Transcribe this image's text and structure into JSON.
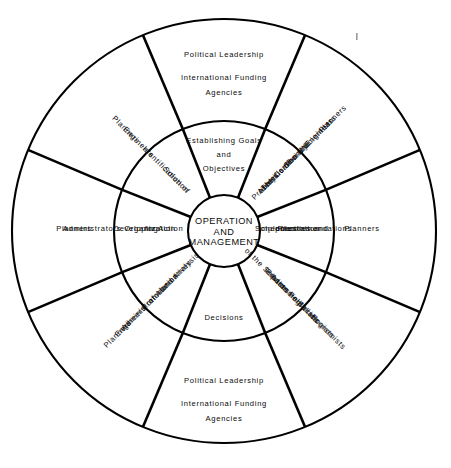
{
  "diagram": {
    "hub": {
      "line1": "OPERATION",
      "line2": "AND",
      "line3": "MANAGEMENT"
    },
    "inner_ring": [
      {
        "id": "establishing-goals",
        "text": "Establishing Goals and Objectives"
      },
      {
        "id": "identification-of-solution",
        "text": "Identification of Solution"
      },
      {
        "id": "developing-organization",
        "text": "Developing Organization for Action"
      },
      {
        "id": "formulation-of-alternatives",
        "text": "Formulation of Alternatives and Analysis"
      },
      {
        "id": "decisions",
        "text": "Decisions"
      },
      {
        "id": "assessing-impacts",
        "text": "Assessing Impacts of the Solution"
      },
      {
        "id": "recommendations",
        "text": "Recommendations priorities and Implementation Schedules"
      },
      {
        "id": "identification-of-problem",
        "text": "Identification and Analysis of Problem"
      }
    ],
    "inner_ring_lines": {
      "establishing-goals": [
        "Establishing Goals",
        "and",
        "Objectives"
      ],
      "identification-of-solution": [
        "Identification of",
        "Solution"
      ],
      "developing-organization": [
        "Developing",
        "Organization",
        "for Action"
      ],
      "formulation-of-alternatives": [
        "Formulation",
        "of Alternatives",
        "and Analysis"
      ],
      "decisions": [
        "Decisions"
      ],
      "assessing-impacts": [
        "Assessing",
        "Impacts",
        "of the Solution"
      ],
      "recommendations": [
        "Recommendations",
        "priorities and",
        "Implementation",
        "Schedules"
      ],
      "identification-of-problem": [
        "Identification and",
        "Analysis of",
        "Problem"
      ]
    },
    "outer_ring": [
      {
        "id": "top",
        "text": "Political Leadership International Funding Agencies",
        "lines": [
          "Political  Leadership",
          "International Funding",
          "Agencies"
        ]
      },
      {
        "id": "upper-right",
        "text": "Planners Engineers",
        "lines": [
          "Planners",
          "Engineers"
        ]
      },
      {
        "id": "right",
        "text": "Planners Administrators",
        "lines": [
          "Planners",
          "Administrators"
        ]
      },
      {
        "id": "lower-right",
        "text": "Planners Engineers Administrators",
        "lines": [
          "Planners",
          "Engineers",
          "Administrators"
        ]
      },
      {
        "id": "bottom",
        "text": "Political Leadership International Funding Agencies",
        "lines": [
          "Political  Leadership",
          "International Funding",
          "Agencies"
        ]
      },
      {
        "id": "lower-left",
        "text": "Economists Sociologists Politicians Environmentalists",
        "lines": [
          "Economists",
          "Sociologists",
          "Politicians",
          "Environmentalists"
        ]
      },
      {
        "id": "left",
        "text": "Planners",
        "lines": [
          "Planners"
        ]
      },
      {
        "id": "upper-left",
        "text": "Planners Engineers Social Scientists The UN The Community",
        "lines": [
          "Planners",
          "Engineers",
          "Social Scientists",
          "The UN",
          "The Community"
        ]
      }
    ],
    "colors": {
      "stroke": "#000000",
      "background": "#ffffff",
      "text": "#0b0b0b"
    },
    "geometry": {
      "center_x": 224,
      "center_y": 231,
      "hub_radius": 36,
      "inner_ring_radius": 110,
      "outer_ring_radius": 212
    }
  }
}
